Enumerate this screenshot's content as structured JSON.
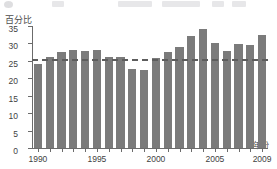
{
  "chart_data": {
    "type": "bar",
    "title": "",
    "subtitle": "",
    "xlabel": "年份",
    "ylabel": "百分比",
    "categories": [
      "1990",
      "1991",
      "1992",
      "1993",
      "1994",
      "1995",
      "1996",
      "1997",
      "1998",
      "1999",
      "2000",
      "2001",
      "2002",
      "2003",
      "2004",
      "2005",
      "2006",
      "2007",
      "2008",
      "2009"
    ],
    "values": [
      24.2,
      26.1,
      27.6,
      28.1,
      27.7,
      28.1,
      26.1,
      26.1,
      22.7,
      22.3,
      25.8,
      27.5,
      29.1,
      32.0,
      34.2,
      30.1,
      27.8,
      29.9,
      29.6,
      32.4
    ],
    "ylim": [
      0,
      35
    ],
    "yticks": [
      0,
      5,
      10,
      15,
      20,
      25,
      30,
      35
    ],
    "xtick_labels": [
      "1990",
      "1995",
      "2000",
      "2005",
      "2009"
    ],
    "xtick_categories": [
      "1990",
      "1995",
      "2000",
      "2005",
      "2009"
    ],
    "grid": false,
    "legend": null,
    "reference_line": {
      "value": 25,
      "style": "dashed",
      "color": "#5d5d5d"
    },
    "bar_color": "#7b7b7b",
    "axis_color": "#6b6b6b"
  },
  "axes": {
    "y_axis_title": "百分比",
    "x_axis_title": "年份"
  }
}
